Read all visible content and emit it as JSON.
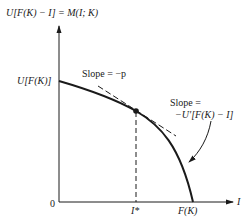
{
  "diagram": {
    "y_axis_label": "U[F(K) − I] = M(I; K)",
    "x_axis_label": "I",
    "origin_label": "0",
    "y_intercept_label": "U[F(K)]",
    "x_intercept_label": "F(K)",
    "optimum_label": "I*",
    "slope_label_top": "Slope = −p",
    "slope_label_curve_line1": "Slope =",
    "slope_label_curve_line2": "−U′[F(K) − I]",
    "colors": {
      "ink": "#1a1a1a",
      "background": "#ffffff"
    }
  }
}
